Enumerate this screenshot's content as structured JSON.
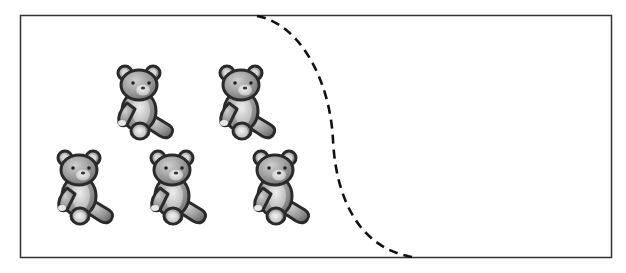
{
  "figure": {
    "frame_color": "#333333",
    "divider_style": "dashed",
    "divider_color": "#111111",
    "bear_icon": "teddy-bear-icon",
    "bear_count": 5,
    "rows": [
      {
        "row": "top",
        "count": 2
      },
      {
        "row": "bottom",
        "count": 3
      }
    ],
    "colors": {
      "bear_fill": "#9a9a9a",
      "bear_light": "#d8d8d8",
      "bear_outline": "#2a2a2a"
    }
  }
}
